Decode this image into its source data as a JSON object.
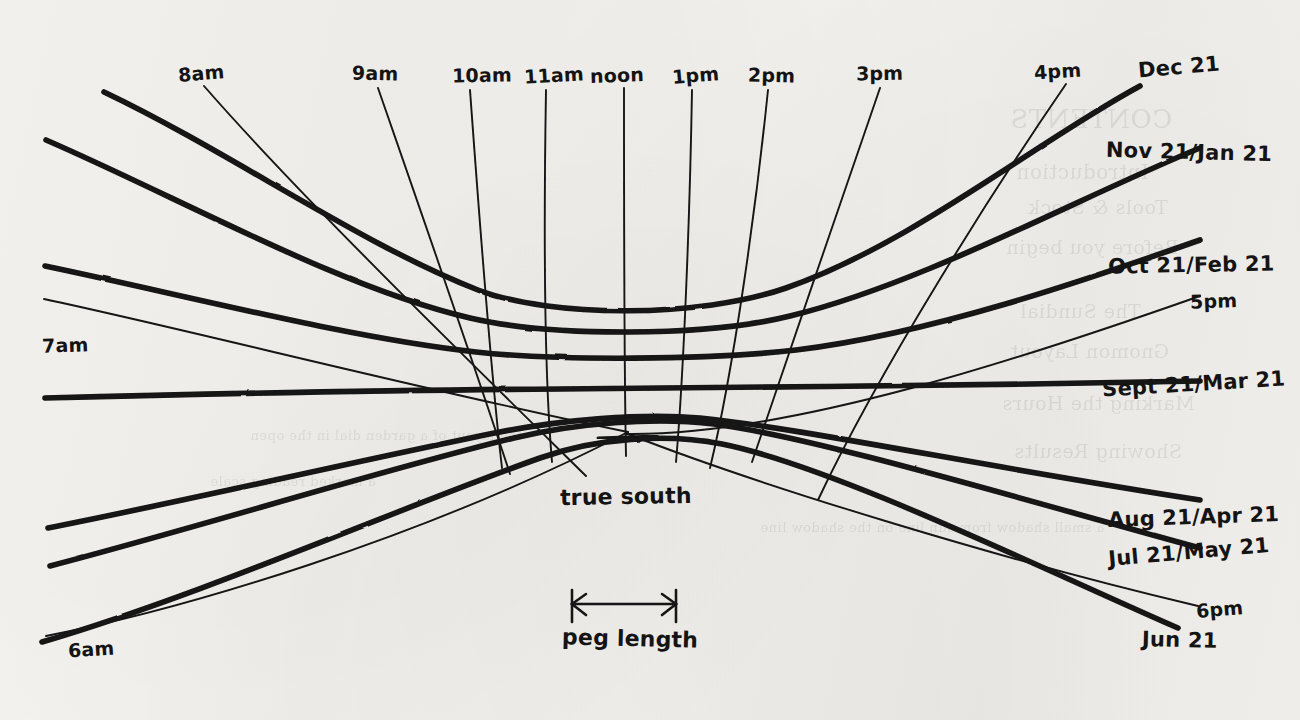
{
  "figure": {
    "kind": "hand-drawn-sundial-diagram",
    "ink_color": "#141414",
    "paper_color": "#f4f2ee"
  },
  "center_annotations": {
    "true_south": "true south",
    "peg_length": "peg length"
  },
  "hour_lines": [
    {
      "label": "6am",
      "label_x": 68,
      "label_y": 638,
      "weight": "thin"
    },
    {
      "label": "7am",
      "label_x": 42,
      "label_y": 334,
      "weight": "thin"
    },
    {
      "label": "8am",
      "label_x": 178,
      "label_y": 62,
      "weight": "thin"
    },
    {
      "label": "9am",
      "label_x": 352,
      "label_y": 62,
      "weight": "thin"
    },
    {
      "label": "10am",
      "label_x": 452,
      "label_y": 64,
      "weight": "thin"
    },
    {
      "label": "11am",
      "label_x": 524,
      "label_y": 64,
      "weight": "thin"
    },
    {
      "label": "noon",
      "label_x": 590,
      "label_y": 64,
      "weight": "thin"
    },
    {
      "label": "1pm",
      "label_x": 672,
      "label_y": 64,
      "weight": "thin"
    },
    {
      "label": "2pm",
      "label_x": 748,
      "label_y": 64,
      "weight": "thin"
    },
    {
      "label": "3pm",
      "label_x": 856,
      "label_y": 62,
      "weight": "thin"
    },
    {
      "label": "4pm",
      "label_x": 1034,
      "label_y": 60,
      "weight": "thin"
    },
    {
      "label": "5pm",
      "label_x": 1190,
      "label_y": 290,
      "weight": "thin"
    },
    {
      "label": "6pm",
      "label_x": 1196,
      "label_y": 598,
      "weight": "thin"
    }
  ],
  "declination_curves": [
    {
      "label": "Dec 21",
      "label_x": 1138,
      "label_y": 55,
      "weight": "thick"
    },
    {
      "label": "Nov 21/Jan 21",
      "label_x": 1106,
      "label_y": 140,
      "weight": "thick"
    },
    {
      "label": "Oct 21/Feb 21",
      "label_x": 1108,
      "label_y": 253,
      "weight": "thick"
    },
    {
      "label": "Sept 21/Mar 21",
      "label_x": 1102,
      "label_y": 372,
      "weight": "thick"
    },
    {
      "label": "Aug 21/Apr 21",
      "label_x": 1108,
      "label_y": 505,
      "weight": "thick"
    },
    {
      "label": "Jul 21/May 21",
      "label_x": 1108,
      "label_y": 540,
      "weight": "thick"
    },
    {
      "label": "Jun 21",
      "label_x": 1142,
      "label_y": 628,
      "weight": "thick"
    }
  ],
  "ghost_text": [
    {
      "text": "CONTENTS",
      "x": 1010,
      "y": 104,
      "size": 26
    },
    {
      "text": "Introduction",
      "x": 1016,
      "y": 160,
      "size": 20
    },
    {
      "text": "Tools & Stock",
      "x": 1028,
      "y": 196,
      "size": 19
    },
    {
      "text": "Before you begin",
      "x": 1006,
      "y": 236,
      "size": 19
    },
    {
      "text": "The Sundial",
      "x": 1020,
      "y": 300,
      "size": 19
    },
    {
      "text": "Gnomon Layout",
      "x": 1010,
      "y": 340,
      "size": 19
    },
    {
      "text": "Marking the Hours",
      "x": 1002,
      "y": 392,
      "size": 19
    },
    {
      "text": "Showing Results",
      "x": 1014,
      "y": 440,
      "size": 19
    },
    {
      "text": "a small shadow from sun line on the shadow line",
      "x": 760,
      "y": 520,
      "size": 13
    },
    {
      "text": "the layout of a garden dial in the open",
      "x": 250,
      "y": 428,
      "size": 13
    },
    {
      "text": "a marked reading scale",
      "x": 210,
      "y": 474,
      "size": 13
    }
  ]
}
